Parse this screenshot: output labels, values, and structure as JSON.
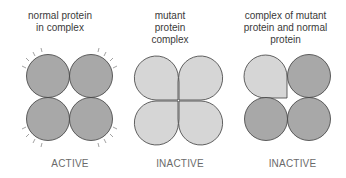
{
  "panels": [
    {
      "caption_lines": [
        "normal protein",
        "in complex"
      ],
      "status": "ACTIVE"
    },
    {
      "caption_lines": [
        "mutant",
        "protein",
        "complex"
      ],
      "status": "INACTIVE"
    },
    {
      "caption_lines": [
        "complex of mutant",
        "protein and normal",
        "protein"
      ],
      "status": "INACTIVE"
    }
  ],
  "colors": {
    "normal_protein": "#a8a8a8",
    "mutant_protein": "#d6d6d6",
    "outline": "#3c3c3c"
  }
}
